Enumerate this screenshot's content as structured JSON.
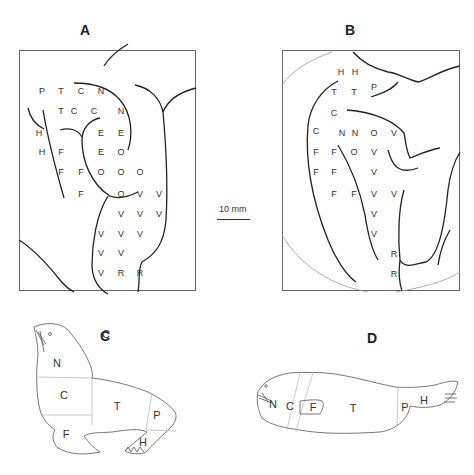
{
  "panels": {
    "A": {
      "label": "A"
    },
    "B": {
      "label": "B"
    },
    "C": {
      "label": "C"
    },
    "D": {
      "label": "D"
    }
  },
  "scale_bar": {
    "label": "10 mm"
  },
  "panel_a_letters": [
    {
      "t": "P",
      "x": 42,
      "y": 92
    },
    {
      "t": "T",
      "x": 61,
      "y": 92
    },
    {
      "t": "C",
      "x": 81,
      "y": 92
    },
    {
      "t": "N",
      "x": 101,
      "y": 92
    },
    {
      "t": "T",
      "x": 61,
      "y": 112
    },
    {
      "t": "C",
      "x": 74,
      "y": 112
    },
    {
      "t": "C",
      "x": 94,
      "y": 112
    },
    {
      "t": "N",
      "x": 121,
      "y": 112
    },
    {
      "t": "H",
      "x": 39,
      "y": 134
    },
    {
      "t": "E",
      "x": 101,
      "y": 134
    },
    {
      "t": "E",
      "x": 121,
      "y": 134
    },
    {
      "t": "H",
      "x": 42,
      "y": 153
    },
    {
      "t": "F",
      "x": 61,
      "y": 153
    },
    {
      "t": "E",
      "x": 101,
      "y": 153
    },
    {
      "t": "O",
      "x": 121,
      "y": 153
    },
    {
      "t": "F",
      "x": 61,
      "y": 173
    },
    {
      "t": "F",
      "x": 81,
      "y": 173
    },
    {
      "t": "O",
      "x": 101,
      "y": 173
    },
    {
      "t": "O",
      "x": 121,
      "y": 173
    },
    {
      "t": "O",
      "x": 140,
      "y": 173
    },
    {
      "t": "F",
      "x": 81,
      "y": 195
    },
    {
      "t": "O",
      "x": 121,
      "y": 195
    },
    {
      "t": "V",
      "x": 140,
      "y": 195
    },
    {
      "t": "V",
      "x": 159,
      "y": 195
    },
    {
      "t": "V",
      "x": 121,
      "y": 215
    },
    {
      "t": "V",
      "x": 140,
      "y": 215
    },
    {
      "t": "V",
      "x": 159,
      "y": 215
    },
    {
      "t": "V",
      "x": 101,
      "y": 235
    },
    {
      "t": "V",
      "x": 121,
      "y": 235
    },
    {
      "t": "V",
      "x": 140,
      "y": 235
    },
    {
      "t": "V",
      "x": 101,
      "y": 254
    },
    {
      "t": "V",
      "x": 121,
      "y": 254
    },
    {
      "t": "V",
      "x": 101,
      "y": 274
    },
    {
      "t": "R",
      "x": 121,
      "y": 274
    },
    {
      "t": "R",
      "x": 140,
      "y": 274
    }
  ],
  "panel_b_letters": [
    {
      "t": "H",
      "x": 341,
      "y": 73
    },
    {
      "t": "H",
      "x": 355,
      "y": 73
    },
    {
      "t": "T",
      "x": 334,
      "y": 93
    },
    {
      "t": "T",
      "x": 354,
      "y": 93
    },
    {
      "t": "P",
      "x": 374,
      "y": 88
    },
    {
      "t": "C",
      "x": 334,
      "y": 114
    },
    {
      "t": "C",
      "x": 316,
      "y": 132
    },
    {
      "t": "N",
      "x": 342,
      "y": 134
    },
    {
      "t": "N",
      "x": 355,
      "y": 134
    },
    {
      "t": "O",
      "x": 374,
      "y": 134
    },
    {
      "t": "V",
      "x": 394,
      "y": 134
    },
    {
      "t": "F",
      "x": 316,
      "y": 153
    },
    {
      "t": "F",
      "x": 334,
      "y": 153
    },
    {
      "t": "O",
      "x": 354,
      "y": 153
    },
    {
      "t": "V",
      "x": 374,
      "y": 153
    },
    {
      "t": "F",
      "x": 316,
      "y": 173
    },
    {
      "t": "F",
      "x": 334,
      "y": 173
    },
    {
      "t": "V",
      "x": 374,
      "y": 173
    },
    {
      "t": "F",
      "x": 334,
      "y": 195
    },
    {
      "t": "F",
      "x": 354,
      "y": 195
    },
    {
      "t": "V",
      "x": 374,
      "y": 195
    },
    {
      "t": "V",
      "x": 394,
      "y": 195
    },
    {
      "t": "V",
      "x": 374,
      "y": 215
    },
    {
      "t": "V",
      "x": 374,
      "y": 235
    },
    {
      "t": "R",
      "x": 394,
      "y": 255
    },
    {
      "t": "R",
      "x": 394,
      "y": 275
    }
  ],
  "panel_c_letters": [
    {
      "t": "N",
      "x": 57,
      "y": 364
    },
    {
      "t": "C",
      "x": 64,
      "y": 396
    },
    {
      "t": "T",
      "x": 117,
      "y": 407
    },
    {
      "t": "P",
      "x": 157,
      "y": 416
    },
    {
      "t": "F",
      "x": 66,
      "y": 435
    },
    {
      "t": "H",
      "x": 143,
      "y": 443
    }
  ],
  "panel_d_letters": [
    {
      "t": "N",
      "x": 273,
      "y": 405
    },
    {
      "t": "C",
      "x": 290,
      "y": 407
    },
    {
      "t": "F",
      "x": 313,
      "y": 408
    },
    {
      "t": "T",
      "x": 353,
      "y": 409
    },
    {
      "t": "P",
      "x": 405,
      "y": 408
    },
    {
      "t": "H",
      "x": 424,
      "y": 401
    }
  ]
}
